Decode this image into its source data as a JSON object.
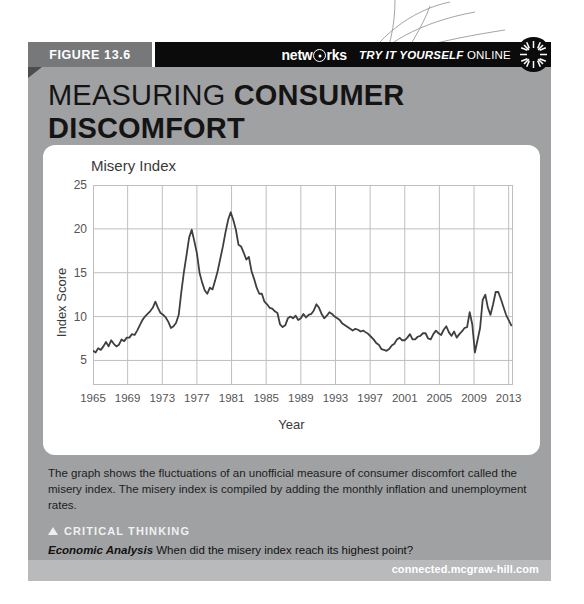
{
  "figure": {
    "label": "FIGURE 13.6"
  },
  "header": {
    "brand_part1": "netw",
    "brand_icon": "circled-o-icon",
    "brand_part2": "rks",
    "tryit_italic": "TRY IT YOURSELF",
    "tryit_plain": "ONLINE",
    "sun_icon": "sunburst-icon"
  },
  "title": {
    "line1_light": "MEASURING ",
    "line1_bold": "CONSUMER",
    "line2_bold": "DISCOMFORT"
  },
  "caption": {
    "text": "The graph shows the fluctuations of an unofficial measure of consumer discomfort called the misery index. The misery index is compiled by adding the monthly inflation and unemployment rates."
  },
  "critical_thinking": {
    "heading": "CRITICAL THINKING",
    "label": "Economic Analysis",
    "question": "When did the misery index reach its highest point?"
  },
  "footer": {
    "url": "connected.mcgraw-hill.com"
  },
  "colors": {
    "panel_gray": "#a0a1a3",
    "tab_gray": "#77787a",
    "header_black": "#0b0b0c",
    "footer_gray": "#b9babb",
    "line": "#3f3f3f",
    "grid": "#bfbfbf"
  },
  "chart_data": {
    "type": "line",
    "title": "Misery Index",
    "xlabel": "Year",
    "ylabel": "Index Score",
    "xlim": [
      1965,
      2013.5
    ],
    "ylim": [
      2.2,
      25
    ],
    "yticks": [
      5,
      10,
      15,
      20,
      25
    ],
    "xticks": [
      1965,
      1969,
      1973,
      1977,
      1981,
      1985,
      1989,
      1993,
      1997,
      2001,
      2005,
      2009,
      2013
    ],
    "grid": true,
    "legend": "none",
    "series": [
      {
        "name": "Misery Index",
        "x": [
          1965.0,
          1965.3,
          1965.6,
          1965.9,
          1966.2,
          1966.5,
          1966.8,
          1967.1,
          1967.4,
          1967.7,
          1968.0,
          1968.3,
          1968.6,
          1968.9,
          1969.2,
          1969.5,
          1969.8,
          1970.1,
          1970.4,
          1970.7,
          1971.0,
          1971.3,
          1971.6,
          1971.9,
          1972.2,
          1972.5,
          1972.8,
          1973.1,
          1973.4,
          1973.7,
          1974.0,
          1974.3,
          1974.6,
          1974.9,
          1975.2,
          1975.5,
          1975.8,
          1976.1,
          1976.4,
          1976.7,
          1977.0,
          1977.3,
          1977.6,
          1977.9,
          1978.2,
          1978.5,
          1978.8,
          1979.1,
          1979.4,
          1979.7,
          1980.0,
          1980.3,
          1980.6,
          1980.9,
          1981.2,
          1981.5,
          1981.8,
          1982.1,
          1982.4,
          1982.7,
          1983.0,
          1983.3,
          1983.6,
          1983.9,
          1984.2,
          1984.5,
          1984.8,
          1985.1,
          1985.4,
          1985.7,
          1986.0,
          1986.3,
          1986.6,
          1986.9,
          1987.2,
          1987.5,
          1987.8,
          1988.1,
          1988.4,
          1988.7,
          1989.0,
          1989.3,
          1989.6,
          1989.9,
          1990.2,
          1990.5,
          1990.8,
          1991.1,
          1991.4,
          1991.7,
          1992.0,
          1992.3,
          1992.6,
          1992.9,
          1993.2,
          1993.5,
          1993.8,
          1994.1,
          1994.4,
          1994.7,
          1995.0,
          1995.3,
          1995.6,
          1995.9,
          1996.2,
          1996.5,
          1996.8,
          1997.1,
          1997.4,
          1997.7,
          1998.0,
          1998.3,
          1998.6,
          1998.9,
          1999.2,
          1999.5,
          1999.8,
          2000.1,
          2000.4,
          2000.7,
          2001.0,
          2001.3,
          2001.6,
          2001.9,
          2002.2,
          2002.5,
          2002.8,
          2003.1,
          2003.4,
          2003.7,
          2004.0,
          2004.3,
          2004.6,
          2004.9,
          2005.2,
          2005.5,
          2005.8,
          2006.1,
          2006.4,
          2006.7,
          2007.0,
          2007.3,
          2007.6,
          2007.9,
          2008.2,
          2008.5,
          2008.8,
          2009.1,
          2009.4,
          2009.7,
          2010.0,
          2010.3,
          2010.6,
          2010.9,
          2011.2,
          2011.5,
          2011.8,
          2012.1,
          2012.4,
          2012.7,
          2013.0,
          2013.3
        ],
        "y": [
          6.1,
          5.9,
          6.4,
          6.2,
          6.6,
          7.1,
          6.6,
          7.3,
          6.9,
          6.6,
          6.8,
          7.4,
          7.2,
          7.6,
          7.6,
          8.0,
          7.9,
          8.4,
          9.0,
          9.6,
          10.0,
          10.3,
          10.6,
          11.0,
          11.7,
          11.0,
          10.4,
          10.2,
          9.9,
          9.4,
          8.7,
          8.9,
          9.3,
          10.2,
          12.8,
          15.1,
          17.0,
          19.0,
          19.9,
          18.6,
          17.2,
          15.0,
          13.9,
          13.0,
          12.6,
          13.3,
          13.1,
          14.1,
          15.2,
          16.6,
          18.0,
          19.6,
          21.0,
          21.9,
          21.0,
          19.9,
          18.2,
          18.0,
          17.3,
          16.5,
          16.8,
          15.2,
          14.3,
          13.3,
          12.6,
          12.6,
          11.7,
          11.4,
          11.0,
          10.9,
          10.6,
          10.4,
          9.1,
          8.8,
          9.0,
          9.8,
          10.0,
          9.8,
          10.1,
          9.6,
          9.8,
          10.3,
          9.9,
          10.2,
          10.3,
          10.7,
          11.4,
          11.0,
          10.3,
          9.8,
          10.1,
          10.5,
          10.3,
          10.0,
          9.8,
          9.6,
          9.2,
          9.0,
          8.8,
          8.6,
          8.4,
          8.6,
          8.5,
          8.3,
          8.4,
          8.2,
          8.0,
          7.7,
          7.4,
          7.0,
          6.8,
          6.3,
          6.2,
          6.1,
          6.3,
          6.7,
          6.9,
          7.4,
          7.6,
          7.3,
          7.3,
          7.6,
          8.0,
          7.4,
          7.4,
          7.7,
          7.8,
          8.1,
          8.1,
          7.5,
          7.4,
          8.0,
          8.4,
          8.1,
          7.9,
          8.5,
          8.9,
          8.2,
          7.8,
          8.3,
          7.6,
          8.0,
          8.3,
          8.7,
          8.8,
          10.5,
          9.1,
          5.9,
          7.3,
          8.7,
          11.9,
          12.5,
          11.0,
          10.2,
          11.4,
          12.8,
          12.8,
          12.0,
          11.1,
          10.2,
          9.6,
          9.0
        ]
      }
    ]
  }
}
